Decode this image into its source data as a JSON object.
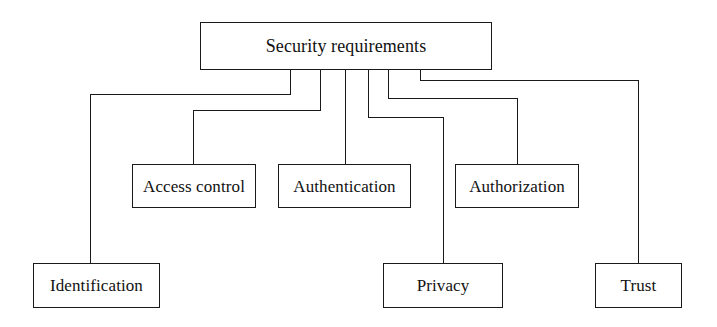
{
  "diagram": {
    "type": "tree-hierarchy",
    "title_node": "Security requirements",
    "line_color": "#1a1a1a",
    "box_fill": "#ffffff",
    "background": "#ffffff",
    "nodes": [
      {
        "id": "root",
        "label": "Security requirements",
        "level": 0,
        "x": 200,
        "y": 22,
        "w": 292,
        "h": 48
      },
      {
        "id": "access-control",
        "label": "Access control",
        "level": 1,
        "x": 132,
        "y": 164,
        "w": 124,
        "h": 44
      },
      {
        "id": "authentication",
        "label": "Authentication",
        "level": 1,
        "x": 278,
        "y": 164,
        "w": 133,
        "h": 44
      },
      {
        "id": "authorization",
        "label": "Authorization",
        "level": 1,
        "x": 455,
        "y": 164,
        "w": 124,
        "h": 44
      },
      {
        "id": "identification",
        "label": "Identification",
        "level": 2,
        "x": 33,
        "y": 263,
        "w": 127,
        "h": 45
      },
      {
        "id": "privacy",
        "label": "Privacy",
        "level": 2,
        "x": 383,
        "y": 263,
        "w": 120,
        "h": 45
      },
      {
        "id": "trust",
        "label": "Trust",
        "level": 2,
        "x": 595,
        "y": 263,
        "w": 87,
        "h": 45
      }
    ],
    "edges": [
      {
        "from": "root",
        "to": "identification",
        "path": "M 290 70 L 290 94 L 90 94 L 90 263"
      },
      {
        "from": "root",
        "to": "access-control",
        "path": "M 320 70 L 320 110 L 193 110 L 193 164"
      },
      {
        "from": "root",
        "to": "authentication",
        "path": "M 345 70 L 345 164"
      },
      {
        "from": "root",
        "to": "privacy",
        "path": "M 368 70 L 368 117 L 443 117 L 443 263"
      },
      {
        "from": "root",
        "to": "authorization",
        "path": "M 388 70 L 388 98 L 517 98 L 517 164"
      },
      {
        "from": "root",
        "to": "trust",
        "path": "M 420 70 L 420 80 L 638 80 L 638 263"
      }
    ]
  }
}
